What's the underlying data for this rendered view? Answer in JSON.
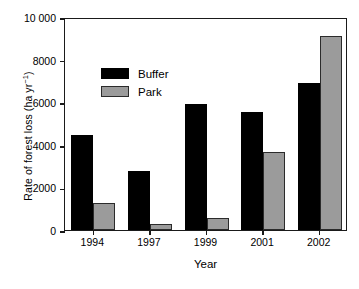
{
  "chart_data": {
    "type": "bar",
    "title": "",
    "subtitle": "",
    "xlabel": "Year",
    "ylabel": "Rate of forest loss (ha yr⁻¹)",
    "ylabel_text": "Rate of forest loss (ha yr",
    "ylabel_exponent": "−1",
    "ylabel_tail": ")",
    "categories": [
      "1994",
      "1997",
      "1999",
      "2001",
      "2002"
    ],
    "series": [
      {
        "name": "Buffer",
        "color": "#000000",
        "values": [
          4450,
          2750,
          5900,
          5550,
          6880
        ]
      },
      {
        "name": "Park",
        "color": "#9b9b9b",
        "values": [
          1250,
          300,
          560,
          3650,
          9120
        ]
      }
    ],
    "ylim": [
      0,
      10000
    ],
    "yticks": [
      0,
      2000,
      4000,
      6000,
      8000,
      10000
    ],
    "ytick_labels": [
      "0",
      "2000",
      "4000",
      "6000",
      "8000",
      "10 000"
    ],
    "grid": false,
    "legend_position": "upper-left-inside",
    "legend_entries": [
      "Buffer",
      "Park"
    ],
    "annotations": []
  },
  "axes": {
    "y_title": "Rate of forest loss (ha yr⁻¹)",
    "x_title": "Year"
  },
  "legend": {
    "items": [
      {
        "label": "Buffer",
        "swatch": "black-filled-rect"
      },
      {
        "label": "Park",
        "swatch": "gray-filled-rect"
      }
    ]
  }
}
